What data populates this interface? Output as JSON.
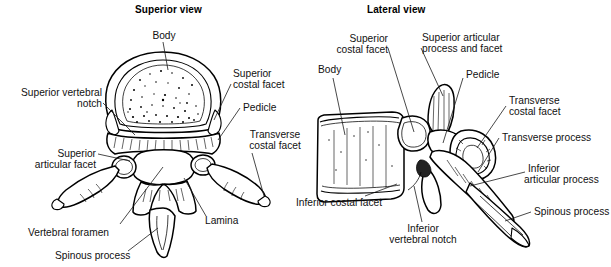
{
  "figure": {
    "background_color": "#ffffff",
    "ink_color": "#000000"
  },
  "views": [
    {
      "id": "superior",
      "title": "Superior view"
    },
    {
      "id": "lateral",
      "title": "Lateral view"
    }
  ],
  "superior_labels": {
    "body": "Body",
    "superior_vertebral_notch_l1": "Superior vertebral",
    "superior_vertebral_notch_l2": "notch",
    "superior_articular_facet_l1": "Superior",
    "superior_articular_facet_l2": "articular facet",
    "vertebral_foramen": "Vertebral foramen",
    "spinous_process": "Spinous process",
    "superior_costal_facet_l1": "Superior",
    "superior_costal_facet_l2": "costal facet",
    "pedicle": "Pedicle",
    "transverse_costal_facet_l1": "Transverse",
    "transverse_costal_facet_l2": "costal facet",
    "lamina": "Lamina"
  },
  "lateral_labels": {
    "superior_costal_facet_l1": "Superior",
    "superior_costal_facet_l2": "costal facet",
    "body": "Body",
    "superior_articular_process_l1": "Superior articular",
    "superior_articular_process_l2": "process and facet",
    "pedicle": "Pedicle",
    "transverse_costal_facet_l1": "Transverse",
    "transverse_costal_facet_l2": "costal facet",
    "transverse_process": "Transverse process",
    "inferior_articular_process_l1": "Inferior",
    "inferior_articular_process_l2": "articular process",
    "spinous_process": "Spinous process",
    "inferior_costal_facet": "Inferior costal facet",
    "inferior_vertebral_notch_l1": "Inferior",
    "inferior_vertebral_notch_l2": "vertebral notch"
  }
}
